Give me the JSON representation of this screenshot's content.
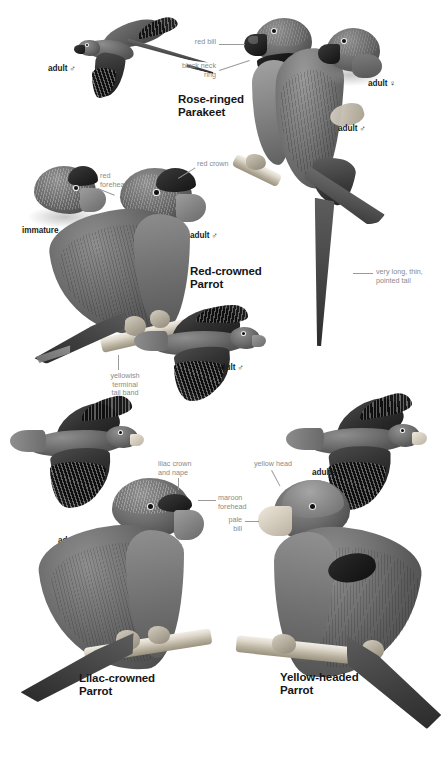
{
  "plate": {
    "background_color": "#ffffff",
    "width": 445,
    "height": 766,
    "label_color": "#8a8a8a",
    "text_color": "#161616"
  },
  "species": [
    {
      "id": "rose-ringed-parakeet",
      "name": "Rose-ringed\nParakeet",
      "features": [
        {
          "id": "red-bill",
          "text": "red bill"
        },
        {
          "id": "black-neck-ring",
          "text": "black neck\nring"
        },
        {
          "id": "pointed-tail",
          "text": "very long, thin,\npointed tail"
        }
      ],
      "figures": [
        {
          "id": "flight-adult-male",
          "label": "adult ♂"
        },
        {
          "id": "perched-adult-male",
          "label": "adult ♂"
        },
        {
          "id": "head-adult-female",
          "label": "adult ♀"
        }
      ]
    },
    {
      "id": "red-crowned-parrot",
      "name": "Red-crowned\nParrot",
      "features": [
        {
          "id": "red-forehead",
          "text": "red\nforehead"
        },
        {
          "id": "red-crown",
          "text": "red crown"
        },
        {
          "id": "yellowish-terminal-tail-band",
          "text": "yellowish\nterminal\ntail band"
        }
      ],
      "figures": [
        {
          "id": "head-immature",
          "label": "immature"
        },
        {
          "id": "perched-adult-male",
          "label": "adult ♂"
        },
        {
          "id": "flight-adult-male",
          "label": "adult ♂"
        }
      ]
    },
    {
      "id": "lilac-crowned-parrot",
      "name": "Lilac-crowned\nParrot",
      "features": [
        {
          "id": "lilac-crown-and-nape",
          "text": "lilac crown\nand nape"
        },
        {
          "id": "maroon-forehead",
          "text": "maroon\nforehead"
        }
      ],
      "figures": [
        {
          "id": "flight-adults",
          "label": "adults"
        },
        {
          "id": "perched-adult",
          "label": ""
        }
      ]
    },
    {
      "id": "yellow-headed-parrot",
      "name": "Yellow-headed\nParrot",
      "features": [
        {
          "id": "yellow-head",
          "text": "yellow head"
        },
        {
          "id": "pale-bill",
          "text": "pale\nbill"
        }
      ],
      "figures": [
        {
          "id": "flight-adults",
          "label": "adults"
        },
        {
          "id": "perched-adult",
          "label": ""
        }
      ]
    }
  ],
  "labels": {
    "adult_male": "adult ♂",
    "adult_female": "adult ♀",
    "adults": "adults",
    "immature": "immature"
  }
}
